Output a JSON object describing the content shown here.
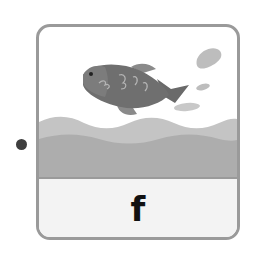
{
  "card": {
    "letter": "f",
    "illustration": "fish-jumping-out-of-water",
    "colors": {
      "border": "#9a9a9a",
      "fish_body": "#6f6f6f",
      "fish_accent": "#a8a8a8",
      "water_light": "#c4c4c4",
      "water_dark": "#adadad",
      "splash": "#bdbdbd",
      "label_bg": "#f3f3f3",
      "letter": "#111111"
    }
  },
  "bullet": {
    "color": "#3e3e3e"
  }
}
